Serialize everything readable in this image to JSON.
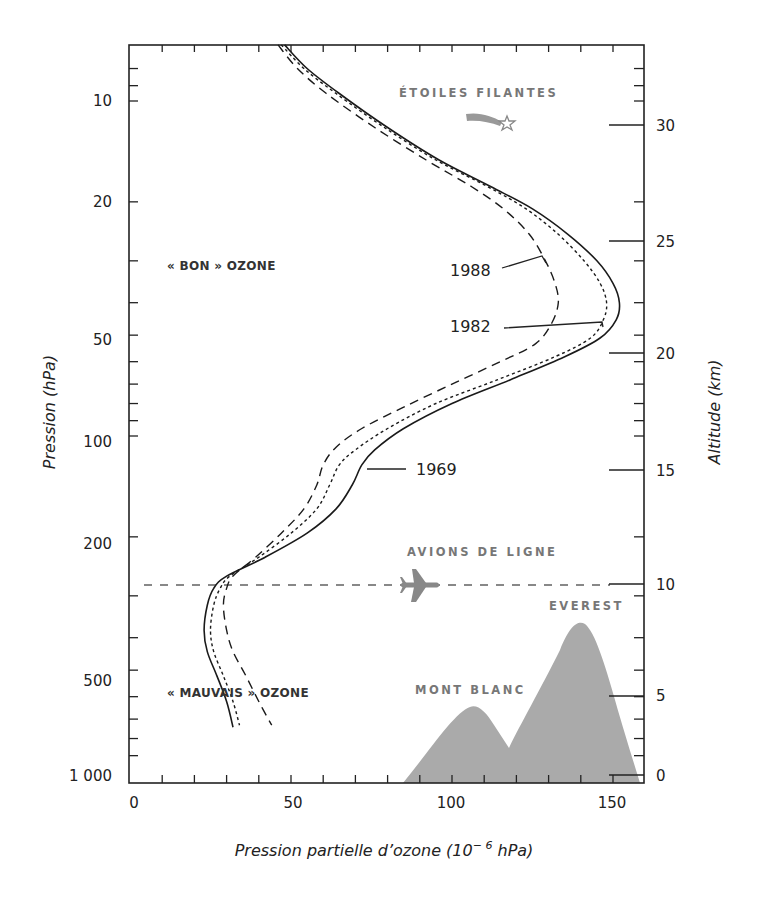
{
  "chart_data": {
    "type": "line",
    "title": "",
    "xlabel": "Pression partielle d’ozone (10⁻⁶ hPa)",
    "ylabel": "Pression (hPa)",
    "y2label": "Altitude (km)",
    "xlim": [
      0,
      160
    ],
    "ylim": [
      1000,
      6.8
    ],
    "yscale": "log",
    "x_ticks": [
      0,
      50,
      100,
      150
    ],
    "x_tick_labels": [
      "0",
      "50",
      "100",
      "150"
    ],
    "x_minor_step": 10,
    "y_ticks": [
      10,
      20,
      50,
      100,
      200,
      500,
      1000
    ],
    "y_tick_labels": [
      "10",
      "20",
      "50",
      "100",
      "200",
      "500",
      "1 000"
    ],
    "y2_ticks": [
      0,
      5,
      10,
      15,
      20,
      25,
      30
    ],
    "y2_tick_labels": [
      "0",
      "5",
      "10",
      "15",
      "20",
      "25",
      "30"
    ],
    "legend_position": "inline labels",
    "grid": false,
    "series": [
      {
        "name": "1969",
        "style": "solid",
        "points": [
          [
            48,
            6.8
          ],
          [
            55,
            8
          ],
          [
            65,
            9.5
          ],
          [
            80,
            12
          ],
          [
            96,
            15
          ],
          [
            112,
            18
          ],
          [
            125,
            21
          ],
          [
            136,
            25
          ],
          [
            145,
            30
          ],
          [
            150,
            35
          ],
          [
            152,
            40
          ],
          [
            151,
            45
          ],
          [
            146,
            51
          ],
          [
            135,
            58
          ],
          [
            118,
            68
          ],
          [
            100,
            80
          ],
          [
            85,
            95
          ],
          [
            76,
            110
          ],
          [
            72,
            122
          ],
          [
            69,
            140
          ],
          [
            64,
            165
          ],
          [
            55,
            195
          ],
          [
            42,
            230
          ],
          [
            30,
            262
          ],
          [
            26,
            285
          ],
          [
            24,
            320
          ],
          [
            23,
            380
          ],
          [
            24,
            440
          ],
          [
            27,
            520
          ],
          [
            30,
            620
          ],
          [
            32,
            740
          ]
        ]
      },
      {
        "name": "1982",
        "style": "short-dash",
        "points": [
          [
            47,
            6.8
          ],
          [
            54,
            8
          ],
          [
            64,
            9.5
          ],
          [
            79,
            12
          ],
          [
            95,
            15
          ],
          [
            111,
            18
          ],
          [
            123,
            21
          ],
          [
            133,
            25
          ],
          [
            141,
            30
          ],
          [
            146,
            35
          ],
          [
            148,
            40
          ],
          [
            147,
            45
          ],
          [
            143,
            51
          ],
          [
            132,
            58
          ],
          [
            114,
            68
          ],
          [
            95,
            80
          ],
          [
            80,
            95
          ],
          [
            70,
            110
          ],
          [
            65,
            122
          ],
          [
            62,
            140
          ],
          [
            58,
            165
          ],
          [
            50,
            195
          ],
          [
            40,
            230
          ],
          [
            31,
            262
          ],
          [
            28,
            285
          ],
          [
            26,
            320
          ],
          [
            25,
            380
          ],
          [
            26,
            440
          ],
          [
            29,
            520
          ],
          [
            32,
            620
          ],
          [
            34,
            730
          ]
        ]
      },
      {
        "name": "1988",
        "style": "long-dash",
        "points": [
          [
            46,
            6.8
          ],
          [
            52,
            8
          ],
          [
            61,
            9.5
          ],
          [
            76,
            12
          ],
          [
            92,
            15
          ],
          [
            106,
            18
          ],
          [
            116,
            21
          ],
          [
            124,
            25
          ],
          [
            129,
            30
          ],
          [
            132,
            35
          ],
          [
            133,
            40
          ],
          [
            131,
            46
          ],
          [
            126,
            53
          ],
          [
            115,
            60
          ],
          [
            100,
            70
          ],
          [
            85,
            82
          ],
          [
            72,
            95
          ],
          [
            64,
            108
          ],
          [
            60,
            122
          ],
          [
            58,
            140
          ],
          [
            54,
            165
          ],
          [
            47,
            195
          ],
          [
            39,
            230
          ],
          [
            32,
            262
          ],
          [
            30,
            285
          ],
          [
            29,
            320
          ],
          [
            30,
            380
          ],
          [
            32,
            440
          ],
          [
            36,
            520
          ],
          [
            40,
            620
          ],
          [
            44,
            730
          ]
        ]
      }
    ],
    "reference_lines": [
      {
        "label": "AVIONS DE LIGNE",
        "pressure": 265,
        "altitude_km": 10,
        "style": "dashed-gray"
      }
    ],
    "annotations": [
      {
        "text": "ÉTOILES FILANTES",
        "icon": "shooting-star-icon"
      },
      {
        "text": "AVIONS DE LIGNE",
        "icon": "airplane-icon"
      },
      {
        "text": "EVEREST"
      },
      {
        "text": "MONT BLANC"
      },
      {
        "text": "« BON » OZONE"
      },
      {
        "text": "« MAUVAIS » OZONE"
      },
      {
        "text": "1988",
        "series": "1988"
      },
      {
        "text": "1982",
        "series": "1982"
      },
      {
        "text": "1969",
        "series": "1969"
      }
    ],
    "mountains": {
      "fill": "#aaaaaa",
      "mont_blanc_peak_km": 4.8,
      "everest_peak_km": 8.8
    }
  },
  "labels": {
    "etoiles": "ÉTOILES FILANTES",
    "avions": "AVIONS DE LIGNE",
    "everest": "EVEREST",
    "montblanc": "MONT BLANC",
    "bon": "« BON » OZONE",
    "mauvais": "« MAUVAIS » OZONE",
    "y1988": "1988",
    "y1982": "1982",
    "y1969": "1969",
    "xlabel_main": "Pression partielle d’ozone (10",
    "xlabel_exp": "− 6",
    "xlabel_end": " hPa)",
    "ylabel": "Pression (hPa)",
    "y2label": "Altitude (km)"
  },
  "colors": {
    "line": "#1a1a1a",
    "gray": "#888888",
    "mountain": "#aaaaaa"
  }
}
